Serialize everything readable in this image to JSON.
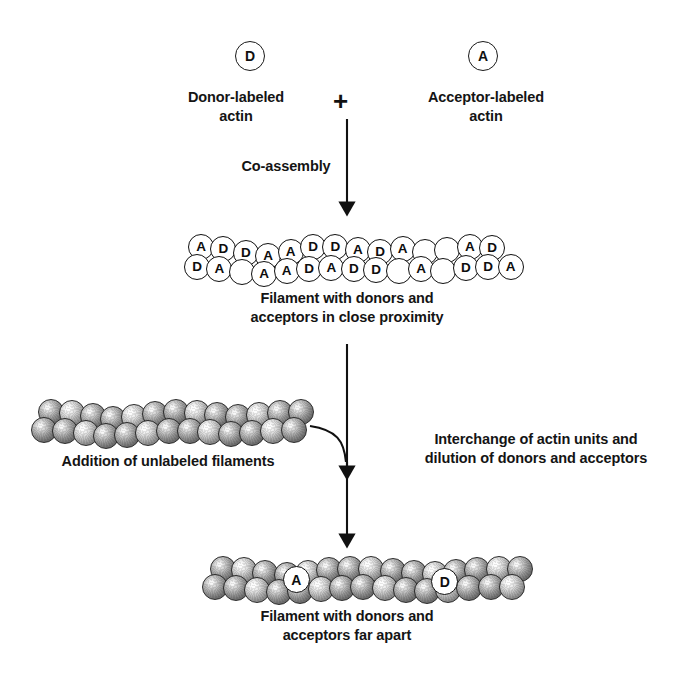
{
  "diagram": {
    "title_absent": true,
    "reagents": [
      {
        "symbol": "D",
        "label": "Donor-labeled\nactin",
        "name": "donor-labeled-actin"
      },
      {
        "symbol": "A",
        "label": "Acceptor-labeled\nactin",
        "name": "acceptor-labeled-actin"
      }
    ],
    "plus_sign": "+",
    "steps": {
      "co_assembly": "Co-assembly",
      "interchange": "Interchange of actin units and\ndilution of donors and acceptors"
    },
    "captions": {
      "labeled_filament": "Filament with donors and\nacceptors in close proximity",
      "unlabeled_filament": "Addition of unlabeled filaments",
      "diluted_filament": "Filament with donors and\nacceptors far apart"
    },
    "labeled_filament": {
      "top_row": [
        "A",
        "D",
        "D",
        "A",
        "A",
        "D",
        "D",
        "A",
        "D",
        "A",
        "",
        "",
        "A",
        "D"
      ],
      "bottom_row": [
        "D",
        "A",
        "",
        "A",
        "A",
        "D",
        "A",
        "D",
        "D",
        "",
        "A",
        "",
        "D",
        "D",
        "A"
      ]
    },
    "diluted_filament": {
      "labels": [
        {
          "symbol": "A",
          "position": "left-of-center"
        },
        {
          "symbol": "D",
          "position": "right-of-center"
        }
      ],
      "unlabeled_subunits": "textured-spheres"
    },
    "colors": {
      "ink": "#111111",
      "background": "#ffffff",
      "sphere_dark": "#555555",
      "sphere_light": "#ffffff"
    }
  }
}
